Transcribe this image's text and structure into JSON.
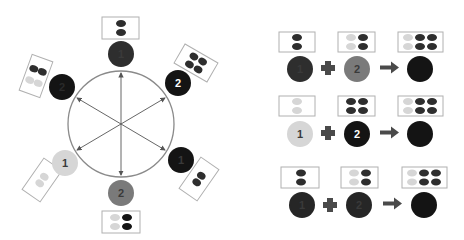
{
  "colors": {
    "black": "#141414",
    "dark": "#2e2e2e",
    "mid": "#7a7a7a",
    "light": "#d6d6d6",
    "ring": "#8a8a8a",
    "box_border": "#b0b0b0"
  },
  "wheel": {
    "nodes": [
      {
        "pos": "top",
        "label": "1",
        "fill": "dark",
        "dots": [
          [
            "dark"
          ],
          [
            "dark"
          ]
        ]
      },
      {
        "pos": "upper-right",
        "label": "2",
        "fill": "black",
        "dots": [
          [
            "dark",
            "dark"
          ],
          [
            "dark",
            "dark"
          ]
        ]
      },
      {
        "pos": "lower-right",
        "label": "1",
        "fill": "black",
        "dots": [
          [
            "dark"
          ],
          [
            "dark"
          ]
        ]
      },
      {
        "pos": "bottom",
        "label": "2",
        "fill": "mid",
        "dots": [
          [
            "light",
            "black"
          ],
          [
            "light",
            "black"
          ]
        ]
      },
      {
        "pos": "lower-left",
        "label": "1",
        "fill": "light",
        "dots": [
          [
            "light"
          ],
          [
            "light"
          ]
        ]
      },
      {
        "pos": "upper-left",
        "label": "2",
        "fill": "black",
        "dots": [
          [
            "dark",
            "dark"
          ],
          [
            "light",
            "light"
          ]
        ]
      }
    ]
  },
  "equations": [
    {
      "a": {
        "label": "1",
        "fill": "dark"
      },
      "b": {
        "label": "2",
        "fill": "mid"
      },
      "result": {
        "label": "",
        "fill": "black"
      },
      "op": "+",
      "arrow": "→"
    },
    {
      "a": {
        "label": "1",
        "fill": "light"
      },
      "b": {
        "label": "2",
        "fill": "black"
      },
      "result": {
        "label": "",
        "fill": "black"
      },
      "op": "+",
      "arrow": "→"
    },
    {
      "a": {
        "label": "1",
        "fill": "black"
      },
      "b": {
        "label": "2",
        "fill": "black"
      },
      "result": {
        "label": "",
        "fill": "black"
      },
      "op": "+",
      "arrow": "→"
    }
  ],
  "labels": {
    "w0": "1",
    "w1": "2",
    "w2": "1",
    "w3": "2",
    "w4": "1",
    "w5": "2",
    "e0a": "1",
    "e0b": "2",
    "e1a": "1",
    "e1b": "2",
    "e2a": "1",
    "e2b": "2"
  }
}
